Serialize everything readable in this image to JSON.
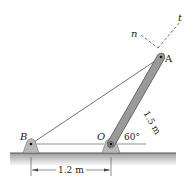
{
  "diagram": {
    "labels": {
      "A": "A",
      "B": "B",
      "O": "O",
      "n": "n",
      "t": "t",
      "length_OA": "1.5 m",
      "angle": "60°",
      "distance_BO": "1.2 m"
    },
    "colors": {
      "bar": "#9a9a9a",
      "bar_edge": "#555555",
      "support": "#b8b8b8",
      "ground_top": "#9c9c9c",
      "ground_bottom": "#ffffff",
      "line": "#222222"
    }
  }
}
